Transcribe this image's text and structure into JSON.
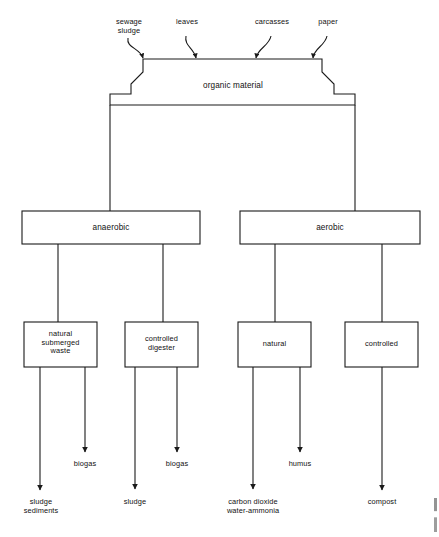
{
  "diagram": {
    "line_color": "#1a1a1a",
    "box_fill": "#ffffff",
    "background": "#ffffff"
  },
  "sources": [
    {
      "id": "sewage-sludge",
      "label": "sewage\nsludge"
    },
    {
      "id": "leaves",
      "label": "leaves"
    },
    {
      "id": "carcasses",
      "label": "carcasses"
    },
    {
      "id": "paper",
      "label": "paper"
    }
  ],
  "root": {
    "id": "organic-material",
    "label": "organic material"
  },
  "branches": [
    {
      "id": "anaerobic",
      "label": "anaerobic"
    },
    {
      "id": "aerobic",
      "label": "aerobic"
    }
  ],
  "processes": [
    {
      "id": "natural-submerged-waste",
      "label": "natural\nsubmerged\nwaste",
      "parent": "anaerobic"
    },
    {
      "id": "controlled-digester",
      "label": "controlled\ndigester",
      "parent": "anaerobic"
    },
    {
      "id": "natural",
      "label": "natural",
      "parent": "aerobic"
    },
    {
      "id": "controlled",
      "label": "controlled",
      "parent": "aerobic"
    }
  ],
  "outputs": [
    {
      "id": "biogas-1",
      "label": "biogas",
      "parent": "natural-submerged-waste"
    },
    {
      "id": "sludge-sediments",
      "label": "sludge\nsediments",
      "parent": "natural-submerged-waste"
    },
    {
      "id": "biogas-2",
      "label": "biogas",
      "parent": "controlled-digester"
    },
    {
      "id": "sludge",
      "label": "sludge",
      "parent": "controlled-digester"
    },
    {
      "id": "humus",
      "label": "humus",
      "parent": "natural"
    },
    {
      "id": "carbon-dioxide-water-ammonia",
      "label": "carbon dioxide\nwater-ammonia",
      "parent": "natural"
    },
    {
      "id": "compost",
      "label": "compost",
      "parent": "controlled"
    }
  ]
}
